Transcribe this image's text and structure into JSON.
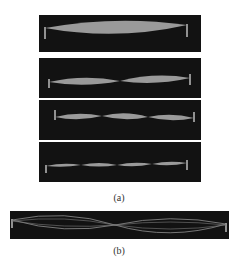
{
  "figure": {
    "part_a": {
      "caption": "(a)",
      "panels": [
        {
          "mode": 1,
          "loops": 1
        },
        {
          "mode": 2,
          "loops": 2
        },
        {
          "mode": 3,
          "loops": 3
        },
        {
          "mode": 4,
          "loops": 4
        }
      ]
    },
    "part_b": {
      "caption": "(b)",
      "description": "string vibrating with superposed standing wave envelopes"
    },
    "colors": {
      "panel_background": "#121212",
      "wave": "#9a9a9a",
      "clamp": "#bdbdbd",
      "background": "#ffffff"
    }
  }
}
